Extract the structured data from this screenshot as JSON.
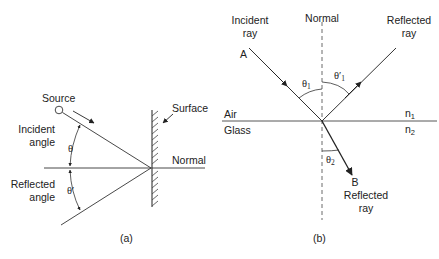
{
  "figure": {
    "panel_a": {
      "caption": "(a)",
      "labels": {
        "source": "Source",
        "surface": "Surface",
        "normal": "Normal",
        "incident_angle_line1": "Incident",
        "incident_angle_line2": "angle",
        "reflected_angle_line1": "Reflected",
        "reflected_angle_line2": "angle",
        "theta": "θ",
        "theta_prime": "θ′"
      }
    },
    "panel_b": {
      "caption": "(b)",
      "labels": {
        "incident_ray_line1": "Incident",
        "incident_ray_line2": "ray",
        "normal": "Normal",
        "reflected_ray_top_line1": "Reflected",
        "reflected_ray_top_line2": "ray",
        "point_a": "A",
        "point_b": "B",
        "reflected_ray_bottom_line1": "Reflected",
        "reflected_ray_bottom_line2": "ray",
        "air": "Air",
        "glass": "Glass",
        "n1": "n",
        "n1_sub": "1",
        "n2": "n",
        "n2_sub": "2",
        "theta1": "θ",
        "theta1_sub": "1",
        "theta1_prime": "θ′",
        "theta1_prime_sub": "1",
        "theta2": "θ",
        "theta2_sub": "2"
      }
    },
    "colors": {
      "line": "#333333",
      "text": "#222222",
      "background": "#ffffff"
    }
  }
}
